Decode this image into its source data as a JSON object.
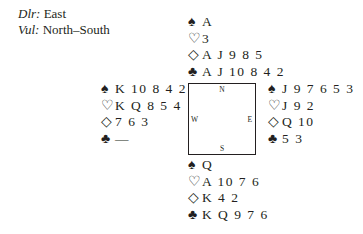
{
  "meta": {
    "dealer_label": "Dlr:",
    "dealer": "East",
    "vul_label": "Vul:",
    "vul": "North–South"
  },
  "suit_symbols": {
    "spades": "♠",
    "hearts": "♡",
    "diamonds": "◇",
    "clubs": "♣"
  },
  "compass": {
    "n": "N",
    "s": "S",
    "w": "W",
    "e": "E"
  },
  "hands": {
    "north": {
      "spades": "A",
      "hearts": "3",
      "diamonds": "A J 9 8 5",
      "clubs": "A J 10 8 4 2"
    },
    "west": {
      "spades": "K 10 8 4 2",
      "hearts": "K Q 8 5 4",
      "diamonds": "7 6 3",
      "clubs": "—"
    },
    "east": {
      "spades": "J 9 7 6 5 3",
      "hearts": "J 9 2",
      "diamonds": "Q 10",
      "clubs": "5 3"
    },
    "south": {
      "spades": "Q",
      "hearts": "A 10 7 6",
      "diamonds": "K 4 2",
      "clubs": "K Q 9 7 6"
    }
  }
}
